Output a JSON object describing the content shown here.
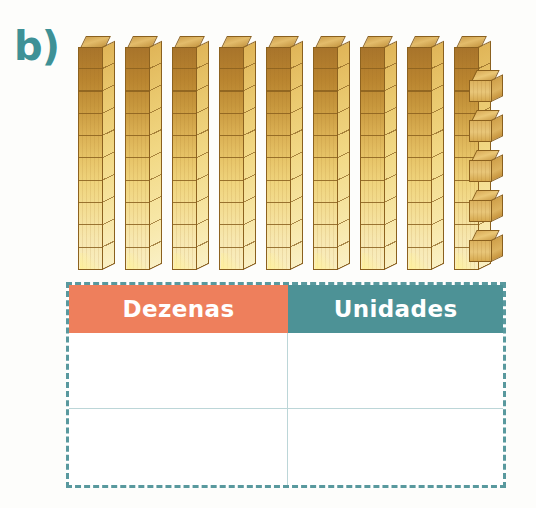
{
  "exercise": {
    "label": "b)",
    "label_color": "#3e9196"
  },
  "manipulatives": {
    "description": "base-ten blocks",
    "tens": {
      "count": 9,
      "units_per_rod": 10,
      "icon": "tens-rod-icon",
      "total_value": 90
    },
    "units": {
      "count": 5,
      "icon": "unit-cube-icon",
      "total_value": 5
    },
    "represented_number": 95
  },
  "table": {
    "name": "place-value-table",
    "border_style": "dashed",
    "border_color": "#59999e",
    "columns": [
      {
        "label": "Dezenas",
        "header_color": "#ee7f5c"
      },
      {
        "label": "Unidades",
        "header_color": "#4d9296"
      }
    ],
    "rows": [
      {
        "dezenas": "",
        "unidades": ""
      },
      {
        "dezenas": "",
        "unidades": ""
      }
    ],
    "grid_line_color": "#bcd6d8"
  }
}
